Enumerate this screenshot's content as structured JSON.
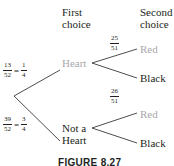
{
  "headers": {
    "first_line1": "First",
    "first_line2": "choice",
    "second_line1": "Second",
    "second_line2": "choice"
  },
  "first_level": {
    "heart": {
      "label": "Heart",
      "prob_num": "13",
      "prob_den": "52",
      "eq": "=",
      "simp_num": "1",
      "simp_den": "4"
    },
    "not_heart": {
      "label_line1": "Not a",
      "label_line2": "Heart",
      "prob_num": "39",
      "prob_den": "52",
      "eq": "=",
      "simp_num": "3",
      "simp_den": "4"
    }
  },
  "second_level": {
    "after_heart": {
      "red": {
        "label": "Red",
        "prob_num": "25",
        "prob_den": "51"
      },
      "black": {
        "label": "Black",
        "prob_num": "26",
        "prob_den": "51"
      }
    },
    "after_not_heart": {
      "red": {
        "label": "Red"
      },
      "black": {
        "label": "Black"
      }
    }
  },
  "colors": {
    "line": "#231f20",
    "muted_label": "#a7a9ac",
    "text": "#231f20"
  },
  "caption": "FIGURE 8.27"
}
